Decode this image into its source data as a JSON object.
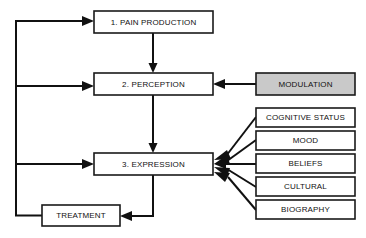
{
  "diagram": {
    "colors": {
      "stroke": "#111111",
      "box_fill": "#ffffff",
      "shaded_fill": "#c9c9c9",
      "text": "#111111",
      "background": "#ffffff"
    },
    "nodes": [
      {
        "id": "pain-production",
        "label": "1. PAIN PRODUCTION",
        "x": 94,
        "y": 11,
        "w": 119,
        "h": 22,
        "shaded": false
      },
      {
        "id": "perception",
        "label": "2. PERCEPTION",
        "x": 94,
        "y": 73,
        "w": 119,
        "h": 22,
        "shaded": false
      },
      {
        "id": "expression",
        "label": "3. EXPRESSION",
        "x": 94,
        "y": 153,
        "w": 119,
        "h": 22,
        "shaded": false
      },
      {
        "id": "treatment",
        "label": "TREATMENT",
        "x": 42,
        "y": 205,
        "w": 78,
        "h": 21,
        "shaded": false
      },
      {
        "id": "modulation",
        "label": "MODULATION",
        "x": 256,
        "y": 73,
        "w": 99,
        "h": 22,
        "shaded": true
      },
      {
        "id": "cognitive-status",
        "label": "COGNITIVE STATUS",
        "x": 256,
        "y": 108,
        "w": 99,
        "h": 19,
        "shaded": false
      },
      {
        "id": "mood",
        "label": "MOOD",
        "x": 256,
        "y": 131,
        "w": 99,
        "h": 19,
        "shaded": false
      },
      {
        "id": "beliefs",
        "label": "BELIEFS",
        "x": 256,
        "y": 154,
        "w": 99,
        "h": 19,
        "shaded": false
      },
      {
        "id": "cultural",
        "label": "CULTURAL",
        "x": 256,
        "y": 177,
        "w": 99,
        "h": 19,
        "shaded": false
      },
      {
        "id": "biography",
        "label": "BIOGRAPHY",
        "x": 256,
        "y": 200,
        "w": 99,
        "h": 19,
        "shaded": false
      }
    ],
    "edges": [
      {
        "id": "pain-to-perception",
        "from": "pain-production",
        "to": "perception",
        "path": "M 153 33 L 153 69",
        "head": "153,73 148.5,63 157.5,63"
      },
      {
        "id": "perception-to-expression",
        "from": "perception",
        "to": "expression",
        "path": "M 153 95 L 153 149",
        "head": "153,153 148.5,143 157.5,143"
      },
      {
        "id": "modulation-to-perception",
        "from": "modulation",
        "to": "perception",
        "path": "M 256 84 L 224 84",
        "head": "213,84 225,79 225,89"
      },
      {
        "id": "expression-to-treatment",
        "from": "expression",
        "to": "treatment",
        "path": "M 153 175 L 153 216 L 132 216",
        "head": "120,216 132,211 132,221"
      },
      {
        "id": "treatment-to-spine",
        "from": "treatment",
        "to": "feedback-spine",
        "path": "M 42 215.5 L 16 215.5 L 16 21 L 82 21"
      },
      {
        "id": "spine-to-pain-production",
        "from": "feedback-spine",
        "to": "pain-production",
        "path": "M 16 21 L 82 21",
        "head": "94,21 82,16 82,26"
      },
      {
        "id": "spine-to-perception",
        "from": "feedback-spine",
        "to": "perception",
        "path": "M 16 86 L 82 86",
        "head": "94,86 82,81 82,91"
      },
      {
        "id": "spine-to-expression",
        "from": "feedback-spine",
        "to": "expression",
        "path": "M 16 164 L 82 164",
        "head": "94,164 82,159 82,169"
      },
      {
        "id": "cognitive-status-to-expression",
        "from": "cognitive-status",
        "to": "expression",
        "path": "M 256 117 L 226 156",
        "head": "214,160 227,150 231,159"
      },
      {
        "id": "mood-to-expression",
        "from": "mood",
        "to": "expression",
        "path": "M 256 140 L 227 161",
        "head": "214,164 227,155 230,164"
      },
      {
        "id": "beliefs-to-expression",
        "from": "beliefs",
        "to": "expression",
        "path": "M 256 164 L 226 164",
        "head": "214,164 226,159 226,169"
      },
      {
        "id": "cultural-to-expression",
        "from": "cultural",
        "to": "expression",
        "path": "M 256 187 L 227 169",
        "head": "214,167 230,168 227,177"
      },
      {
        "id": "biography-to-expression",
        "from": "biography",
        "to": "expression",
        "path": "M 256 210 L 228 177",
        "head": "214,172 230,173 225,182"
      }
    ]
  }
}
